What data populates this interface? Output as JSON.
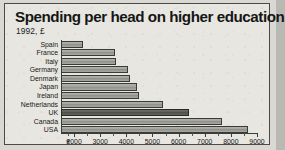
{
  "header": {
    "title": "Spending per head on higher education",
    "subtitle": "1992, £"
  },
  "axis": {
    "break_marker": "✶",
    "tick_labels": [
      "2000",
      "3000",
      "4000",
      "5000",
      "6000",
      "7000",
      "8000",
      "9000"
    ]
  },
  "colors": {
    "panel_background": "#e7e6e0",
    "page_background": "#d9d8d2",
    "border": "#4a4a46",
    "bar_fill": "#a3a39d",
    "bar_highlight_fill": "#5d5d59",
    "bar_outline": "#3a3a37",
    "text": "#161616"
  },
  "chart_data": {
    "type": "bar",
    "orientation": "horizontal",
    "title": "Spending per head on higher education",
    "subtitle": "1992, £",
    "xlabel": "",
    "ylabel": "",
    "xlim": [
      1500,
      9000
    ],
    "axis_break": true,
    "grid": false,
    "legend": null,
    "highlighted_category": "UK",
    "units": "£ per head",
    "year": 1992,
    "xticks": [
      2000,
      3000,
      4000,
      5000,
      6000,
      7000,
      8000,
      9000
    ],
    "categories": [
      "Spain",
      "France",
      "Italy",
      "Germany",
      "Denmark",
      "Japan",
      "Ireland",
      "Netherlands",
      "UK",
      "Canada",
      "USA"
    ],
    "values": [
      2350,
      3550,
      3620,
      4080,
      4150,
      4420,
      4500,
      5400,
      6400,
      7650,
      8650
    ]
  }
}
